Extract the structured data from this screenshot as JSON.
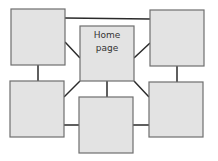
{
  "diagram": {
    "type": "site-map",
    "colors": {
      "box_fill": "#e3e3e3",
      "box_stroke": "#6e6e6e",
      "edge": "#2a2a2a",
      "text": "#333333"
    },
    "nodes": [
      {
        "id": "home",
        "label_line1": "Home",
        "label_line2": "page",
        "x": 80,
        "y": 26,
        "w": 54,
        "h": 55
      },
      {
        "id": "top-left",
        "label": "",
        "x": 11,
        "y": 9,
        "w": 54,
        "h": 56
      },
      {
        "id": "top-right",
        "label": "",
        "x": 150,
        "y": 10,
        "w": 54,
        "h": 56
      },
      {
        "id": "bottom-left",
        "label": "",
        "x": 10,
        "y": 81,
        "w": 54,
        "h": 56
      },
      {
        "id": "bottom-center",
        "label": "",
        "x": 79,
        "y": 97,
        "w": 54,
        "h": 56
      },
      {
        "id": "bottom-right",
        "label": "",
        "x": 149,
        "y": 82,
        "w": 54,
        "h": 55
      }
    ],
    "edges": [
      {
        "from": "top-left",
        "to": "top-right"
      },
      {
        "from": "home",
        "to": "top-left"
      },
      {
        "from": "home",
        "to": "top-right"
      },
      {
        "from": "home",
        "to": "bottom-left"
      },
      {
        "from": "home",
        "to": "bottom-center"
      },
      {
        "from": "home",
        "to": "bottom-right"
      },
      {
        "from": "top-left",
        "to": "bottom-left"
      },
      {
        "from": "top-right",
        "to": "bottom-right"
      },
      {
        "from": "bottom-left",
        "to": "bottom-center"
      },
      {
        "from": "bottom-center",
        "to": "bottom-right"
      }
    ]
  }
}
